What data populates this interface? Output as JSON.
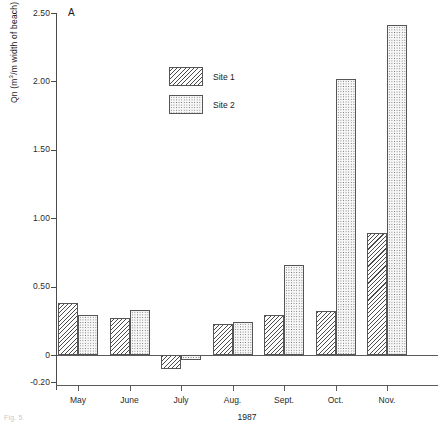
{
  "figure": {
    "panel_label": "A",
    "caption_fragment": "Fig. 5."
  },
  "legend": {
    "position": "upper-left-inside",
    "entries": [
      {
        "label": "Site 1",
        "pattern": "diagonal-hatch"
      },
      {
        "label": "Site 2",
        "pattern": "stipple-dots"
      }
    ]
  },
  "axes": {
    "y_title_prefix": "Qn (m",
    "y_title_exp": "3",
    "y_title_suffix": "/m width of beach)",
    "x_title": "1987",
    "y_ticks": [
      "2.50",
      "2.00",
      "1.50",
      "1.00",
      "0.50",
      "0",
      "-0.20"
    ],
    "x_ticks": [
      "May",
      "June",
      "July",
      "Aug.",
      "Sept.",
      "Oct.",
      "Nov."
    ]
  },
  "chart_data": {
    "type": "bar",
    "title": "A",
    "xlabel": "1987",
    "ylabel": "Qn (m3/m width of beach)",
    "categories": [
      "May",
      "June",
      "July",
      "Aug.",
      "Sept.",
      "Oct.",
      "Nov."
    ],
    "series": [
      {
        "name": "Site 1",
        "pattern": "diagonal-hatch",
        "values": [
          0.38,
          0.27,
          -0.1,
          0.23,
          0.29,
          0.32,
          0.89
        ]
      },
      {
        "name": "Site 2",
        "pattern": "stipple-dots",
        "values": [
          0.29,
          0.33,
          -0.04,
          0.24,
          0.66,
          2.02,
          2.41
        ]
      }
    ],
    "ylim": [
      -0.2,
      2.5
    ],
    "yticks": [
      -0.2,
      0,
      0.5,
      1.0,
      1.5,
      2.0,
      2.5
    ],
    "grid": false,
    "zero_line": true,
    "legend_position": "upper left"
  }
}
